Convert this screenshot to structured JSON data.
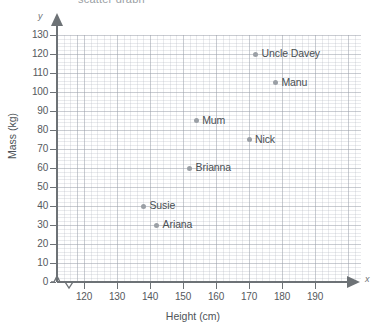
{
  "figure": {
    "title_sliver": "scatter graph",
    "axis_letter_x": "x",
    "axis_letter_y": "y"
  },
  "chart_data": {
    "type": "scatter",
    "title": "",
    "xlabel": "Height (cm)",
    "ylabel": "Mass (kg)",
    "xlim": [
      115,
      192
    ],
    "ylim": [
      0,
      133
    ],
    "xticks": [
      120,
      130,
      140,
      150,
      160,
      170,
      180,
      190
    ],
    "yticks": [
      0,
      10,
      20,
      30,
      40,
      50,
      60,
      70,
      80,
      90,
      100,
      110,
      120,
      130
    ],
    "x_axis_break": true,
    "y_axis_break": true,
    "grid": true,
    "grid_major_step_x": 10,
    "grid_major_step_y": 10,
    "grid_minor_step_x": 2,
    "grid_minor_step_y": 2,
    "legend": "none",
    "point_color": "#9ba0a6",
    "points": [
      {
        "label": "Uncle Davey",
        "x": 172,
        "y": 120
      },
      {
        "label": "Manu",
        "x": 178,
        "y": 105
      },
      {
        "label": "Mum",
        "x": 154,
        "y": 85
      },
      {
        "label": "Nick",
        "x": 170,
        "y": 75
      },
      {
        "label": "Brianna",
        "x": 152,
        "y": 60
      },
      {
        "label": "Susie",
        "x": 138,
        "y": 40
      },
      {
        "label": "Ariana",
        "x": 142,
        "y": 30
      }
    ]
  }
}
